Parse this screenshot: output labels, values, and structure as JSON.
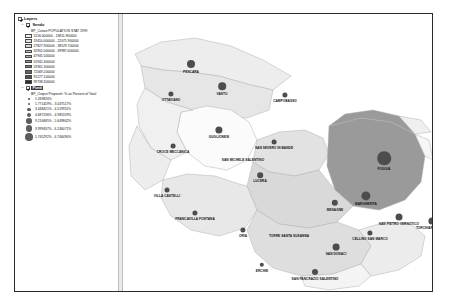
{
  "window": {
    "title": "Layers"
  },
  "toc": {
    "root_label": "Layers",
    "layers": [
      {
        "name": "Sendo",
        "checked": true,
        "expanded": true,
        "field_label": "BP_Cutout POPULATION STAT 1999",
        "type": "graduated-colors",
        "classes": [
          {
            "label": "5156.000000 - 13811.900000",
            "color": "#f2f2f2"
          },
          {
            "label": "19410.000000 - 22071.900000",
            "color": "#e4e4e4"
          },
          {
            "label": "27827.900000 - 38529.700000",
            "color": "#d6d6d6"
          },
          {
            "label": "32902.000000 - 39987.600000",
            "color": "#c2c2c2"
          },
          {
            "label": "47945.500000",
            "color": "#ababab"
          },
          {
            "label": "55942.400000",
            "color": "#949494"
          },
          {
            "label": "59361.300000",
            "color": "#7d7d7d"
          },
          {
            "label": "72069.200000",
            "color": "#666666"
          },
          {
            "label": "91277.100000",
            "color": "#4f4f4f"
          },
          {
            "label": "99738.300000",
            "color": "#2e2e2e"
          }
        ]
      },
      {
        "name": "Punti",
        "checked": true,
        "expanded": true,
        "selected": true,
        "field_label": "BP_Output Proporzh: % as Percent of Total",
        "type": "graduated-symbols",
        "symbols": [
          {
            "label": "1.269826%",
            "size": 1.6
          },
          {
            "label": "1.771459% - 3.047517%",
            "size": 2.4
          },
          {
            "label": "3.448421% - 4.519911%",
            "size": 3.3
          },
          {
            "label": "4.687136% - 4.985319%",
            "size": 4.3
          },
          {
            "label": "9.216685% - 5.649842%",
            "size": 5.6
          },
          {
            "label": "3.999437% - 6.246071%",
            "size": 6.6
          },
          {
            "label": "5.745292% - 6.746490%",
            "size": 7.6
          }
        ]
      }
    ]
  },
  "map": {
    "region_fill_light": "#ededed",
    "region_fill_mid": "#d9d9d9",
    "region_fill_dark": "#9a9a9a",
    "outline": "#b0b0b0",
    "symbol_color": "#4d4d4d",
    "places": [
      {
        "name": "PESCARA",
        "x": 68,
        "y": 50,
        "r": 4.0
      },
      {
        "name": "OTTAVIANO",
        "x": 48,
        "y": 80,
        "r": 2.6
      },
      {
        "name": "VASTO",
        "x": 99,
        "y": 72,
        "r": 3.8
      },
      {
        "name": "CAMPOBASSO",
        "x": 162,
        "y": 81,
        "r": 2.6
      },
      {
        "name": "GUGLIONESI",
        "x": 96,
        "y": 116,
        "r": 3.6
      },
      {
        "name": "CROCE MECCANICA",
        "x": 50,
        "y": 132,
        "r": 2.4
      },
      {
        "name": "SAN SEVERO IN BANDE",
        "x": 151,
        "y": 128,
        "r": 2.4
      },
      {
        "name": "SAN MICHELE SALENTINO",
        "x": 120,
        "y": 144,
        "r": 0
      },
      {
        "name": "FOGGIA",
        "x": 261,
        "y": 144,
        "r": 6.8
      },
      {
        "name": "LUCERA",
        "x": 137,
        "y": 161,
        "r": 2.8
      },
      {
        "name": "VILLA CASTELLI",
        "x": 44,
        "y": 176,
        "r": 2.5
      },
      {
        "name": "FRANCAVILLA FONTANA",
        "x": 72,
        "y": 199,
        "r": 2.6
      },
      {
        "name": "MESAGNE",
        "x": 212,
        "y": 189,
        "r": 3.2
      },
      {
        "name": "MARGHERITA",
        "x": 243,
        "y": 182,
        "r": 4.6
      },
      {
        "name": "SAN PIETRO VERNOTICO",
        "x": 276,
        "y": 203,
        "r": 3.5
      },
      {
        "name": "TORCHIAROLO",
        "x": 309,
        "y": 207,
        "r": 3.6
      },
      {
        "name": "ORIA",
        "x": 120,
        "y": 216,
        "r": 2.6
      },
      {
        "name": "TORRE SANTA SUSANNA",
        "x": 162,
        "y": 216,
        "r": 2.8
      },
      {
        "name": "CELLINO SAN MARCO",
        "x": 247,
        "y": 219,
        "r": 2.6
      },
      {
        "name": "SAN DONACI",
        "x": 213,
        "y": 233,
        "r": 3.4
      },
      {
        "name": "ERCHIE",
        "x": 139,
        "y": 251,
        "r": 2.2
      },
      {
        "name": "SAN PANCRAZIO SALENTINO",
        "x": 192,
        "y": 258,
        "r": 3.0
      }
    ]
  }
}
